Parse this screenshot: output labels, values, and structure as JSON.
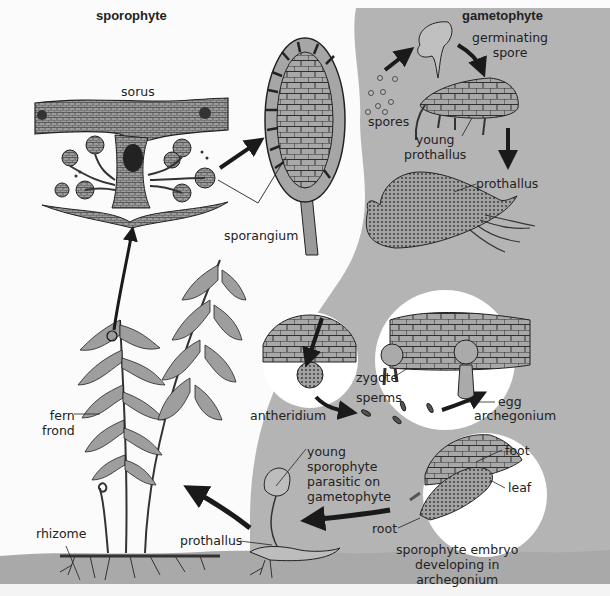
{
  "diagram": {
    "type": "life-cycle",
    "subject": "fern",
    "colors": {
      "gametophyte_background": "#b4b4b4",
      "sporophyte_background": "#fbfbfb",
      "ground": "#a9a9a9",
      "tissue": "#9a9a9a",
      "ink": "#1e1e1e",
      "circle_inset": "#ffffff"
    },
    "regions": {
      "sporophyte_title": "sporophyte",
      "gametophyte_title": "gametophyte"
    },
    "labels": {
      "sorus": "sorus",
      "sporangium": "sporangium",
      "spores": "spores",
      "germinating_spore": "germinating\nspore",
      "young_prothallus": "young\nprothallus",
      "prothallus_top": "prothallus",
      "zygote": "zygote",
      "sperms": "sperms",
      "egg": "egg",
      "archegonium": "archegonium",
      "antheridium": "antheridium",
      "fern_frond": "fern\nfrond",
      "rhizome": "rhizome",
      "prothallus_bottom": "prothallus",
      "young_sporophyte": "young\nsporophyte\nparasitic on\ngametophyte",
      "foot": "foot",
      "leaf": "leaf",
      "root": "root",
      "embryo": "sporophyte embryo\ndeveloping in\narchegonium"
    },
    "stages": [
      {
        "name": "fern frond",
        "phase": "sporophyte"
      },
      {
        "name": "sorus",
        "phase": "sporophyte"
      },
      {
        "name": "sporangium",
        "phase": "sporophyte"
      },
      {
        "name": "spores",
        "phase": "gametophyte"
      },
      {
        "name": "germinating spore",
        "phase": "gametophyte"
      },
      {
        "name": "young prothallus",
        "phase": "gametophyte"
      },
      {
        "name": "prothallus",
        "phase": "gametophyte"
      },
      {
        "name": "antheridium / archegonium",
        "phase": "gametophyte"
      },
      {
        "name": "sperms fertilize egg → zygote",
        "phase": "gametophyte"
      },
      {
        "name": "sporophyte embryo developing in archegonium",
        "phase": "sporophyte"
      },
      {
        "name": "young sporophyte parasitic on gametophyte",
        "phase": "sporophyte"
      }
    ]
  }
}
